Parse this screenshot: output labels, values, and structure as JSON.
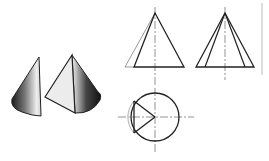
{
  "diagram": {
    "colors": {
      "line": "#222222",
      "thin_line": "#555555",
      "centerline": "#666666",
      "border": "#bbbbbb",
      "background": "#ffffff"
    },
    "pictorial": {
      "left_piece": "half-cone sliver",
      "right_piece": "cone with planar cut face"
    },
    "views": {
      "front": {
        "label": "front view",
        "apex": [
          155,
          13
        ],
        "base_y": 67,
        "base_x": [
          134,
          184
        ]
      },
      "side": {
        "label": "side view",
        "apex": [
          225,
          13
        ],
        "base_y": 67,
        "base_x": [
          196,
          254
        ]
      },
      "top": {
        "label": "top view",
        "center": [
          155,
          117
        ],
        "radius": 24
      }
    }
  }
}
